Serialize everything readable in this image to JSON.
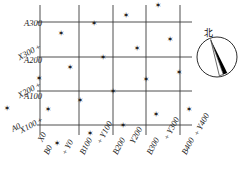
{
  "diagram": {
    "kind": "cadastral-coordinate-grid",
    "stroke_color": "#3a3a3a",
    "text_color": "#1a1a1a",
    "background": "#ffffff",
    "marker_glyph": "✶",
    "plus_glyph": "+"
  },
  "compass": {
    "label": "北",
    "needle_color": "#000000",
    "ring_color": "#2b2b2b",
    "cx": 217,
    "cy": 57,
    "r": 20
  },
  "left_axis": {
    "name": "A / X coordinate labels",
    "labels": [
      {
        "id": "A300",
        "text": "A300",
        "x": 42,
        "y": 19,
        "rotated": false,
        "plus": false
      },
      {
        "id": "X300",
        "text": "X300",
        "x": 40,
        "y": 42,
        "rotated": true,
        "plus": true
      },
      {
        "id": "A200",
        "text": "A200",
        "x": 42,
        "y": 56,
        "rotated": false,
        "plus": false
      },
      {
        "id": "X200",
        "text": "X200",
        "x": 40,
        "y": 80,
        "rotated": true,
        "plus": true
      },
      {
        "id": "A100",
        "text": "A100",
        "x": 42,
        "y": 92,
        "rotated": false,
        "plus": false
      },
      {
        "id": "X100",
        "text": "X100",
        "x": 42,
        "y": 115,
        "rotated": true,
        "plus": true
      },
      {
        "id": "A0",
        "text": "A0",
        "x": 20,
        "y": 121,
        "rotated": true,
        "plus": false
      }
    ]
  },
  "bottom_axis": {
    "name": "B / Y coordinate labels",
    "labels": [
      {
        "id": "X0",
        "text": "X0",
        "x": 36,
        "y": 139,
        "plus": false
      },
      {
        "id": "B0",
        "text": "B0",
        "x": 42,
        "y": 152,
        "plus": false
      },
      {
        "id": "Y0",
        "text": "Y0",
        "x": 60,
        "y": 152,
        "plus": true
      },
      {
        "id": "B100",
        "text": "B100",
        "x": 78,
        "y": 152,
        "plus": false
      },
      {
        "id": "Y100",
        "text": "Y100",
        "x": 95,
        "y": 141,
        "plus": true
      },
      {
        "id": "B200",
        "text": "B200",
        "x": 111,
        "y": 152,
        "plus": false
      },
      {
        "id": "Y200",
        "text": "Y200",
        "x": 128,
        "y": 141,
        "plus": false
      },
      {
        "id": "B300",
        "text": "B300",
        "x": 145,
        "y": 152,
        "plus": false
      },
      {
        "id": "Y300",
        "text": "Y300",
        "x": 162,
        "y": 137,
        "plus": true
      },
      {
        "id": "B400",
        "text": "B400",
        "x": 180,
        "y": 152,
        "plus": false
      },
      {
        "id": "Y400",
        "text": "Y400",
        "x": 192,
        "y": 133,
        "plus": true
      }
    ]
  },
  "grid": {
    "vertical_lines_x": [
      40,
      79,
      113,
      146,
      180
    ],
    "horizontal_lines_y": [
      22,
      57,
      91,
      125
    ],
    "h_extent": [
      37,
      192
    ],
    "v_extent": [
      5,
      135
    ]
  },
  "markers": [
    {
      "x": 158,
      "y": 5
    },
    {
      "x": 126,
      "y": 15
    },
    {
      "x": 94,
      "y": 23
    },
    {
      "x": 61,
      "y": 33
    },
    {
      "x": 170,
      "y": 39
    },
    {
      "x": 137,
      "y": 48
    },
    {
      "x": 103,
      "y": 57
    },
    {
      "x": 70,
      "y": 67
    },
    {
      "x": 179,
      "y": 72
    },
    {
      "x": 146,
      "y": 79
    },
    {
      "x": 39,
      "y": 78
    },
    {
      "x": 113,
      "y": 91
    },
    {
      "x": 80,
      "y": 100
    },
    {
      "x": 48,
      "y": 109
    },
    {
      "x": 7,
      "y": 108
    },
    {
      "x": 156,
      "y": 114
    },
    {
      "x": 123,
      "y": 125
    },
    {
      "x": 57,
      "y": 143
    },
    {
      "x": 90,
      "y": 133
    },
    {
      "x": 189,
      "y": 109
    }
  ]
}
